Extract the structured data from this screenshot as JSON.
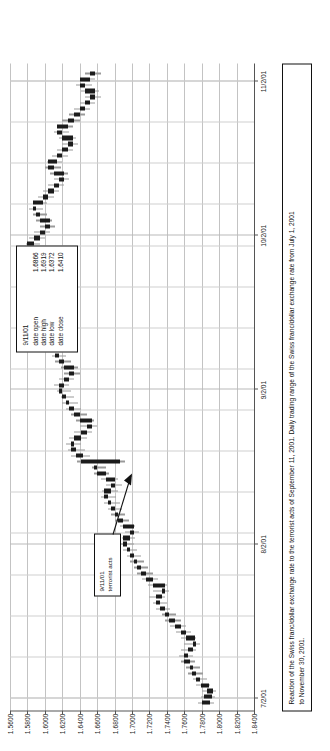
{
  "chart_data": {
    "type": "bar",
    "title": "",
    "xlabel": "",
    "ylabel": "",
    "ylim": [
      1.56,
      1.84
    ],
    "ytick_labels": [
      "1.8400",
      "1.8200",
      "1.8000",
      "1.7800",
      "1.7600",
      "1.7400",
      "1.7200",
      "1.7000",
      "1.6800",
      "1.6600",
      "1.6400",
      "1.6200",
      "1.6000",
      "1.5800",
      "1.5600"
    ],
    "ytick_values": [
      1.84,
      1.82,
      1.8,
      1.78,
      1.76,
      1.74,
      1.72,
      1.7,
      1.68,
      1.66,
      1.64,
      1.62,
      1.6,
      1.58,
      1.56
    ],
    "xtick_labels": [
      "7/2/01",
      "8/2/01",
      "9/2/01",
      "10/2/01",
      "11/2/01"
    ],
    "grid": true,
    "legend": "none",
    "series_name": "Daily trading range (high-low) with open/close body",
    "bars": [
      {
        "i": 0,
        "low": 1.776,
        "high": 1.794,
        "open": 1.78,
        "close": 1.79
      },
      {
        "i": 1,
        "low": 1.779,
        "high": 1.795,
        "open": 1.783,
        "close": 1.792
      },
      {
        "i": 2,
        "low": 1.78,
        "high": 1.796,
        "open": 1.786,
        "close": 1.793
      },
      {
        "i": 3,
        "low": 1.774,
        "high": 1.79,
        "open": 1.788,
        "close": 1.779
      },
      {
        "i": 4,
        "low": 1.77,
        "high": 1.786,
        "open": 1.778,
        "close": 1.774
      },
      {
        "i": 5,
        "low": 1.764,
        "high": 1.782,
        "open": 1.774,
        "close": 1.769
      },
      {
        "i": 6,
        "low": 1.762,
        "high": 1.778,
        "open": 1.77,
        "close": 1.766
      },
      {
        "i": 7,
        "low": 1.756,
        "high": 1.772,
        "open": 1.766,
        "close": 1.76
      },
      {
        "i": 8,
        "low": 1.754,
        "high": 1.77,
        "open": 1.76,
        "close": 1.764
      },
      {
        "i": 9,
        "low": 1.756,
        "high": 1.774,
        "open": 1.764,
        "close": 1.77
      },
      {
        "i": 10,
        "low": 1.76,
        "high": 1.778,
        "open": 1.77,
        "close": 1.774
      },
      {
        "i": 11,
        "low": 1.756,
        "high": 1.774,
        "open": 1.772,
        "close": 1.762
      },
      {
        "i": 12,
        "low": 1.75,
        "high": 1.768,
        "open": 1.762,
        "close": 1.756
      },
      {
        "i": 13,
        "low": 1.744,
        "high": 1.762,
        "open": 1.756,
        "close": 1.749
      },
      {
        "i": 14,
        "low": 1.738,
        "high": 1.756,
        "open": 1.749,
        "close": 1.742
      },
      {
        "i": 15,
        "low": 1.734,
        "high": 1.75,
        "open": 1.742,
        "close": 1.738
      },
      {
        "i": 16,
        "low": 1.728,
        "high": 1.744,
        "open": 1.738,
        "close": 1.732
      },
      {
        "i": 17,
        "low": 1.724,
        "high": 1.74,
        "open": 1.732,
        "close": 1.728
      },
      {
        "i": 18,
        "low": 1.72,
        "high": 1.738,
        "open": 1.728,
        "close": 1.734
      },
      {
        "i": 19,
        "low": 1.724,
        "high": 1.742,
        "open": 1.734,
        "close": 1.738
      },
      {
        "i": 20,
        "low": 1.718,
        "high": 1.74,
        "open": 1.738,
        "close": 1.724
      },
      {
        "i": 21,
        "low": 1.712,
        "high": 1.73,
        "open": 1.724,
        "close": 1.716
      },
      {
        "i": 22,
        "low": 1.706,
        "high": 1.724,
        "open": 1.716,
        "close": 1.71
      },
      {
        "i": 23,
        "low": 1.702,
        "high": 1.718,
        "open": 1.71,
        "close": 1.706
      },
      {
        "i": 24,
        "low": 1.698,
        "high": 1.714,
        "open": 1.706,
        "close": 1.702
      },
      {
        "i": 25,
        "low": 1.694,
        "high": 1.71,
        "open": 1.702,
        "close": 1.698
      },
      {
        "i": 26,
        "low": 1.69,
        "high": 1.706,
        "open": 1.698,
        "close": 1.694
      },
      {
        "i": 27,
        "low": 1.686,
        "high": 1.702,
        "open": 1.694,
        "close": 1.69
      },
      {
        "i": 28,
        "low": 1.688,
        "high": 1.704,
        "open": 1.69,
        "close": 1.698
      },
      {
        "i": 29,
        "low": 1.692,
        "high": 1.708,
        "open": 1.698,
        "close": 1.702
      },
      {
        "i": 30,
        "low": 1.686,
        "high": 1.704,
        "open": 1.702,
        "close": 1.69
      },
      {
        "i": 31,
        "low": 1.68,
        "high": 1.696,
        "open": 1.69,
        "close": 1.684
      },
      {
        "i": 32,
        "low": 1.676,
        "high": 1.692,
        "open": 1.684,
        "close": 1.68
      },
      {
        "i": 33,
        "low": 1.672,
        "high": 1.688,
        "open": 1.68,
        "close": 1.676
      },
      {
        "i": 34,
        "low": 1.668,
        "high": 1.686,
        "open": 1.676,
        "close": 1.672
      },
      {
        "i": 35,
        "low": 1.664,
        "high": 1.682,
        "open": 1.672,
        "close": 1.668
      },
      {
        "i": 36,
        "low": 1.666,
        "high": 1.684,
        "open": 1.668,
        "close": 1.676
      },
      {
        "i": 37,
        "low": 1.67,
        "high": 1.688,
        "open": 1.676,
        "close": 1.68
      },
      {
        "i": 38,
        "low": 1.664,
        "high": 1.684,
        "open": 1.68,
        "close": 1.67
      },
      {
        "i": 39,
        "low": 1.656,
        "high": 1.674,
        "open": 1.67,
        "close": 1.66
      },
      {
        "i": 40,
        "low": 1.654,
        "high": 1.67,
        "open": 1.66,
        "close": 1.656
      },
      {
        "i": 41,
        "low": 1.6372,
        "high": 1.6919,
        "open": 1.6866,
        "close": 1.641,
        "label": "9/11/01"
      },
      {
        "i": 42,
        "low": 1.63,
        "high": 1.652,
        "open": 1.644,
        "close": 1.636
      },
      {
        "i": 43,
        "low": 1.626,
        "high": 1.646,
        "open": 1.636,
        "close": 1.63
      },
      {
        "i": 44,
        "low": 1.624,
        "high": 1.642,
        "open": 1.63,
        "close": 1.634
      },
      {
        "i": 45,
        "low": 1.628,
        "high": 1.648,
        "open": 1.634,
        "close": 1.642
      },
      {
        "i": 46,
        "low": 1.634,
        "high": 1.654,
        "open": 1.642,
        "close": 1.648
      },
      {
        "i": 47,
        "low": 1.64,
        "high": 1.66,
        "open": 1.648,
        "close": 1.654
      },
      {
        "i": 48,
        "low": 1.636,
        "high": 1.656,
        "open": 1.654,
        "close": 1.64
      },
      {
        "i": 49,
        "low": 1.63,
        "high": 1.648,
        "open": 1.64,
        "close": 1.634
      },
      {
        "i": 50,
        "low": 1.624,
        "high": 1.642,
        "open": 1.634,
        "close": 1.628
      },
      {
        "i": 51,
        "low": 1.62,
        "high": 1.638,
        "open": 1.628,
        "close": 1.624
      },
      {
        "i": 52,
        "low": 1.618,
        "high": 1.634,
        "open": 1.624,
        "close": 1.62
      },
      {
        "i": 53,
        "low": 1.614,
        "high": 1.63,
        "open": 1.62,
        "close": 1.616
      },
      {
        "i": 54,
        "low": 1.61,
        "high": 1.628,
        "open": 1.616,
        "close": 1.622
      },
      {
        "i": 55,
        "low": 1.616,
        "high": 1.634,
        "open": 1.622,
        "close": 1.628
      },
      {
        "i": 56,
        "low": 1.622,
        "high": 1.64,
        "open": 1.628,
        "close": 1.634
      },
      {
        "i": 57,
        "low": 1.618,
        "high": 1.638,
        "open": 1.634,
        "close": 1.622
      },
      {
        "i": 58,
        "low": 1.612,
        "high": 1.63,
        "open": 1.622,
        "close": 1.616
      },
      {
        "i": 59,
        "low": 1.608,
        "high": 1.624,
        "open": 1.616,
        "close": 1.612
      },
      {
        "i": 60,
        "low": 1.604,
        "high": 1.62,
        "open": 1.612,
        "close": 1.608
      },
      {
        "i": 61,
        "low": 1.6,
        "high": 1.616,
        "open": 1.608,
        "close": 1.604
      },
      {
        "i": 62,
        "low": 1.596,
        "high": 1.612,
        "open": 1.604,
        "close": 1.6
      },
      {
        "i": 63,
        "low": 1.598,
        "high": 1.614,
        "open": 1.6,
        "close": 1.608
      },
      {
        "i": 64,
        "low": 1.602,
        "high": 1.62,
        "open": 1.608,
        "close": 1.614
      },
      {
        "i": 65,
        "low": 1.608,
        "high": 1.626,
        "open": 1.614,
        "close": 1.62
      },
      {
        "i": 66,
        "low": 1.602,
        "high": 1.624,
        "open": 1.62,
        "close": 1.606
      },
      {
        "i": 67,
        "low": 1.596,
        "high": 1.614,
        "open": 1.606,
        "close": 1.6
      },
      {
        "i": 68,
        "low": 1.59,
        "high": 1.608,
        "open": 1.6,
        "close": 1.594
      },
      {
        "i": 69,
        "low": 1.586,
        "high": 1.602,
        "open": 1.594,
        "close": 1.59
      },
      {
        "i": 70,
        "low": 1.582,
        "high": 1.598,
        "open": 1.59,
        "close": 1.586
      },
      {
        "i": 71,
        "low": 1.584,
        "high": 1.6,
        "open": 1.586,
        "close": 1.594
      },
      {
        "i": 72,
        "low": 1.59,
        "high": 1.606,
        "open": 1.594,
        "close": 1.6
      },
      {
        "i": 73,
        "low": 1.594,
        "high": 1.612,
        "open": 1.6,
        "close": 1.606
      },
      {
        "i": 74,
        "low": 1.59,
        "high": 1.608,
        "open": 1.606,
        "close": 1.594
      },
      {
        "i": 75,
        "low": 1.584,
        "high": 1.6,
        "open": 1.594,
        "close": 1.588
      },
      {
        "i": 76,
        "low": 1.58,
        "high": 1.596,
        "open": 1.588,
        "close": 1.584
      },
      {
        "i": 77,
        "low": 1.576,
        "high": 1.592,
        "open": 1.584,
        "close": 1.58
      },
      {
        "i": 78,
        "low": 1.578,
        "high": 1.594,
        "open": 1.58,
        "close": 1.588
      },
      {
        "i": 79,
        "low": 1.582,
        "high": 1.6,
        "open": 1.588,
        "close": 1.594
      },
      {
        "i": 80,
        "low": 1.588,
        "high": 1.606,
        "open": 1.594,
        "close": 1.6
      },
      {
        "i": 81,
        "low": 1.594,
        "high": 1.612,
        "open": 1.6,
        "close": 1.606
      },
      {
        "i": 82,
        "low": 1.59,
        "high": 1.608,
        "open": 1.606,
        "close": 1.594
      },
      {
        "i": 83,
        "low": 1.586,
        "high": 1.602,
        "open": 1.594,
        "close": 1.59
      },
      {
        "i": 84,
        "low": 1.582,
        "high": 1.598,
        "open": 1.59,
        "close": 1.586
      },
      {
        "i": 85,
        "low": 1.586,
        "high": 1.602,
        "open": 1.586,
        "close": 1.598
      },
      {
        "i": 86,
        "low": 1.592,
        "high": 1.61,
        "open": 1.598,
        "close": 1.604
      },
      {
        "i": 87,
        "low": 1.598,
        "high": 1.616,
        "open": 1.604,
        "close": 1.61
      },
      {
        "i": 88,
        "low": 1.604,
        "high": 1.622,
        "open": 1.61,
        "close": 1.616
      },
      {
        "i": 89,
        "low": 1.61,
        "high": 1.628,
        "open": 1.616,
        "close": 1.622
      },
      {
        "i": 90,
        "low": 1.606,
        "high": 1.626,
        "open": 1.622,
        "close": 1.61
      },
      {
        "i": 91,
        "low": 1.6,
        "high": 1.618,
        "open": 1.61,
        "close": 1.604
      },
      {
        "i": 92,
        "low": 1.602,
        "high": 1.62,
        "open": 1.604,
        "close": 1.614
      },
      {
        "i": 93,
        "low": 1.608,
        "high": 1.626,
        "open": 1.614,
        "close": 1.62
      },
      {
        "i": 94,
        "low": 1.614,
        "high": 1.632,
        "open": 1.62,
        "close": 1.626
      },
      {
        "i": 95,
        "low": 1.62,
        "high": 1.638,
        "open": 1.626,
        "close": 1.632
      },
      {
        "i": 96,
        "low": 1.616,
        "high": 1.636,
        "open": 1.632,
        "close": 1.62
      },
      {
        "i": 97,
        "low": 1.61,
        "high": 1.628,
        "open": 1.62,
        "close": 1.614
      },
      {
        "i": 98,
        "low": 1.614,
        "high": 1.632,
        "open": 1.614,
        "close": 1.626
      },
      {
        "i": 99,
        "low": 1.62,
        "high": 1.64,
        "open": 1.626,
        "close": 1.634
      },
      {
        "i": 100,
        "low": 1.628,
        "high": 1.646,
        "open": 1.634,
        "close": 1.64
      },
      {
        "i": 101,
        "low": 1.634,
        "high": 1.652,
        "open": 1.64,
        "close": 1.646
      },
      {
        "i": 102,
        "low": 1.64,
        "high": 1.658,
        "open": 1.646,
        "close": 1.652
      },
      {
        "i": 103,
        "low": 1.646,
        "high": 1.664,
        "open": 1.652,
        "close": 1.658
      },
      {
        "i": 104,
        "low": 1.642,
        "high": 1.662,
        "open": 1.658,
        "close": 1.646
      },
      {
        "i": 105,
        "low": 1.636,
        "high": 1.654,
        "open": 1.646,
        "close": 1.64
      },
      {
        "i": 106,
        "low": 1.64,
        "high": 1.658,
        "open": 1.64,
        "close": 1.652
      },
      {
        "i": 107,
        "low": 1.646,
        "high": 1.664,
        "open": 1.652,
        "close": 1.658
      }
    ]
  },
  "ohlc_callout": {
    "date": "9/11/01",
    "rows": [
      {
        "key": "date open",
        "value": "1.6866"
      },
      {
        "key": "date high",
        "value": "1.6919"
      },
      {
        "key": "date low",
        "value": "1.6372"
      },
      {
        "key": "date close",
        "value": "1.6410"
      }
    ]
  },
  "event_callout": {
    "date": "9/11/01",
    "text": "terrorist acts"
  },
  "caption": {
    "line1": "Reaction of the Swiss franc/dollar exchange rate to the terrorist acts of September 11, 2001. Daily trading range of the Swiss franc/dollar exchange rate from July 1, 2001",
    "line2": "to November 30, 2001."
  },
  "colors": {
    "bar_range": "#9a9a9a",
    "bar_body": "#1b1b1b",
    "grid": "#b9b9b9",
    "axis": "#555555",
    "text": "#111111"
  }
}
